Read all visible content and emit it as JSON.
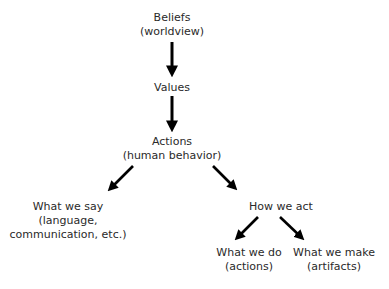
{
  "diagram": {
    "type": "hierarchy-flow",
    "colors": {
      "text": "#2a2a2a",
      "arrow": "#000000",
      "background": "#ffffff"
    },
    "nodes": {
      "beliefs": {
        "title": "Beliefs",
        "subtitle": "(worldview)"
      },
      "values": {
        "title": "Values"
      },
      "actions": {
        "title": "Actions",
        "subtitle": "(human behavior)"
      },
      "say": {
        "title": "What we say",
        "subtitle": "(language,",
        "subtitle2": "communication, etc.)"
      },
      "act": {
        "title": "How we act"
      },
      "do": {
        "title": "What we do",
        "subtitle": "(actions)"
      },
      "make": {
        "title": "What we make",
        "subtitle": "(artifacts)"
      }
    },
    "edges": [
      {
        "from": "beliefs",
        "to": "values"
      },
      {
        "from": "values",
        "to": "actions"
      },
      {
        "from": "actions",
        "to": "say"
      },
      {
        "from": "actions",
        "to": "act"
      },
      {
        "from": "act",
        "to": "do"
      },
      {
        "from": "act",
        "to": "make"
      }
    ]
  }
}
